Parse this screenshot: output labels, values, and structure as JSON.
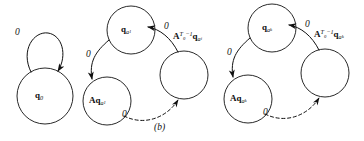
{
  "figure": {
    "caption": "(b)",
    "width": 364,
    "height": 141,
    "ink_color": "#111111",
    "background_color": "#ffffff"
  },
  "diagram": {
    "type": "state-transition-diagram",
    "components": [
      {
        "id": "initial-component",
        "states": [
          {
            "id": "q0",
            "label_plain": "q0",
            "cx": 45,
            "cy": 96,
            "r": 28
          }
        ],
        "transitions": [
          {
            "id": "q0-self-loop",
            "from": "q0",
            "to": "q0",
            "label": "0",
            "style": "solid"
          }
        ]
      },
      {
        "id": "cycle-component-a1",
        "index_symbol": "a1",
        "states": [
          {
            "id": "q-a1",
            "label_plain": "q_{a_1}",
            "cx": 131,
            "cy": 30,
            "r": 24
          },
          {
            "id": "Aq-a1",
            "label_plain": "Aq_{a_1}",
            "cx": 107,
            "cy": 101,
            "r": 24
          },
          {
            "id": "ATq-a1",
            "label_plain": "A^{T_0-1} q_{a_i}",
            "cx": 184,
            "cy": 75,
            "r": 24
          }
        ],
        "transitions": [
          {
            "id": "a1-top-to-left",
            "from": "q-a1",
            "to": "Aq-a1",
            "label": "0",
            "style": "solid"
          },
          {
            "id": "a1-left-to-right",
            "from": "Aq-a1",
            "to": "ATq-a1",
            "label": "0",
            "style": "dashed"
          },
          {
            "id": "a1-right-to-top",
            "from": "ATq-a1",
            "to": "q-a1",
            "label": "0",
            "style": "solid"
          }
        ]
      },
      {
        "id": "cycle-component-ak",
        "index_symbol": "ak",
        "states": [
          {
            "id": "q-ak",
            "label_plain": "q_{a_k}",
            "cx": 272,
            "cy": 28,
            "r": 24
          },
          {
            "id": "Aq-ak",
            "label_plain": "Aq_{a_k}",
            "cx": 248,
            "cy": 99,
            "r": 24
          },
          {
            "id": "ATq-ak",
            "label_plain": "A^{T_0-1} q_{a_k}",
            "cx": 325,
            "cy": 73,
            "r": 24
          }
        ],
        "transitions": [
          {
            "id": "ak-top-to-left",
            "from": "q-ak",
            "to": "Aq-ak",
            "label": "0",
            "style": "solid"
          },
          {
            "id": "ak-left-to-right",
            "from": "Aq-ak",
            "to": "ATq-ak",
            "label": "0",
            "style": "dashed"
          },
          {
            "id": "ak-right-to-top",
            "from": "ATq-ak",
            "to": "q-ak",
            "label": "0",
            "style": "solid"
          }
        ]
      }
    ]
  },
  "labels": {
    "state_q0": {
      "base": "q",
      "sub": "0"
    },
    "state_q_a1": {
      "base": "q",
      "sub": "a",
      "subsub": "1"
    },
    "state_Aq_a1": {
      "prefix": "A",
      "base": "q",
      "sub": "a",
      "subsub": "1"
    },
    "state_ATq_ai": {
      "matrix": "A",
      "sup": "T",
      "supsub": "0",
      "sup_tail": "−1",
      "base": "q",
      "sub": "a",
      "subsub": "i"
    },
    "state_q_ak": {
      "base": "q",
      "sub": "a",
      "subsub": "k"
    },
    "state_Aq_ak": {
      "prefix": "A",
      "base": "q",
      "sub": "a",
      "subsub": "k"
    },
    "state_ATq_ak": {
      "matrix": "A",
      "sup": "T",
      "supsub": "0",
      "sup_tail": "−1",
      "base": "q",
      "sub": "a",
      "subsub": "k"
    },
    "edge_symbol": "0"
  },
  "edge_labels": {
    "q0_loop": "0",
    "a1_left": "0",
    "a1_bottom": "0",
    "a1_right": "0",
    "ak_left": "0",
    "ak_bottom": "0",
    "ak_right": "0"
  }
}
